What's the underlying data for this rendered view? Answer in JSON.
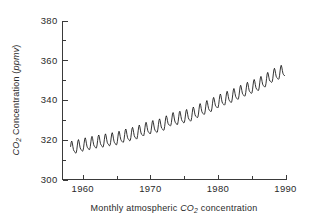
{
  "figure": {
    "caption": "Monthly atmospheric CO2 concentration",
    "caption_parts": {
      "before": "Monthly atmospheric ",
      "species": "CO",
      "species_sub": "2",
      "after": " concentration"
    }
  },
  "chart_data": {
    "type": "line",
    "title": "",
    "subtitle": "",
    "caption": "Monthly atmospheric CO2 concentration",
    "xlabel": "",
    "ylabel": "CO2 Concentration (ppmv)",
    "ylabel_parts": {
      "species": "CO",
      "species_sub": "2",
      "middle": " Concentration (",
      "units": "ppmv",
      "close": ")"
    },
    "xlim": [
      1957.0,
      1990.0
    ],
    "ylim": [
      300,
      380
    ],
    "xticks_major": [
      1960,
      1970,
      1980,
      1990
    ],
    "xticklabels": [
      "1960",
      "1970",
      "1980",
      "1990"
    ],
    "xticks_minor": [
      1965,
      1975,
      1985
    ],
    "yticks_major": [
      300,
      320,
      340,
      360,
      380
    ],
    "yticklabels": [
      "300",
      "320",
      "340",
      "360",
      "380"
    ],
    "yticks_minor": [
      310,
      330,
      350,
      370
    ],
    "grid": false,
    "legend": null,
    "series": [
      {
        "name": "Monthly atmospheric CO2 (Mauna Loa)",
        "color": "#101010",
        "units": "ppmv",
        "sampling": "monthly",
        "x_start": 1958.2,
        "x_end": 1989.9,
        "seasonal_amplitude_ppmv": 3.0,
        "annual_means": [
          {
            "year": 1958,
            "value": 315.3
          },
          {
            "year": 1959,
            "value": 315.9
          },
          {
            "year": 1960,
            "value": 316.9
          },
          {
            "year": 1961,
            "value": 317.6
          },
          {
            "year": 1962,
            "value": 318.4
          },
          {
            "year": 1963,
            "value": 318.9
          },
          {
            "year": 1964,
            "value": 319.6
          },
          {
            "year": 1965,
            "value": 320.0
          },
          {
            "year": 1966,
            "value": 321.3
          },
          {
            "year": 1967,
            "value": 322.1
          },
          {
            "year": 1968,
            "value": 323.0
          },
          {
            "year": 1969,
            "value": 324.6
          },
          {
            "year": 1970,
            "value": 325.6
          },
          {
            "year": 1971,
            "value": 326.3
          },
          {
            "year": 1972,
            "value": 327.4
          },
          {
            "year": 1973,
            "value": 329.7
          },
          {
            "year": 1974,
            "value": 330.2
          },
          {
            "year": 1975,
            "value": 331.1
          },
          {
            "year": 1976,
            "value": 332.0
          },
          {
            "year": 1977,
            "value": 333.8
          },
          {
            "year": 1978,
            "value": 335.4
          },
          {
            "year": 1979,
            "value": 336.8
          },
          {
            "year": 1980,
            "value": 338.7
          },
          {
            "year": 1981,
            "value": 340.1
          },
          {
            "year": 1982,
            "value": 341.4
          },
          {
            "year": 1983,
            "value": 343.0
          },
          {
            "year": 1984,
            "value": 344.6
          },
          {
            "year": 1985,
            "value": 346.0
          },
          {
            "year": 1986,
            "value": 347.4
          },
          {
            "year": 1987,
            "value": 349.2
          },
          {
            "year": 1988,
            "value": 351.6
          },
          {
            "year": 1989,
            "value": 353.1
          }
        ]
      }
    ]
  }
}
